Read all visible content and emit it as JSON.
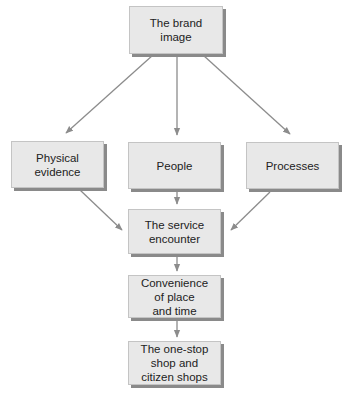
{
  "diagram": {
    "nodes": [
      {
        "id": "brand-image",
        "label": "The brand\nimage"
      },
      {
        "id": "physical-evidence",
        "label": "Physical\nevidence"
      },
      {
        "id": "people",
        "label": "People"
      },
      {
        "id": "processes",
        "label": "Processes"
      },
      {
        "id": "service-encounter",
        "label": "The service\nencounter"
      },
      {
        "id": "convenience",
        "label": "Convenience\nof place\nand time"
      },
      {
        "id": "one-stop-shop",
        "label": "The one-stop\nshop and\ncitizen shops"
      }
    ],
    "edges": [
      {
        "from": "brand-image",
        "to": "physical-evidence"
      },
      {
        "from": "brand-image",
        "to": "people"
      },
      {
        "from": "brand-image",
        "to": "processes"
      },
      {
        "from": "physical-evidence",
        "to": "service-encounter"
      },
      {
        "from": "people",
        "to": "service-encounter"
      },
      {
        "from": "processes",
        "to": "service-encounter"
      },
      {
        "from": "service-encounter",
        "to": "convenience"
      },
      {
        "from": "convenience",
        "to": "one-stop-shop"
      }
    ],
    "colors": {
      "box_fill": "#e8e8e8",
      "box_shadow": "#8a8a8a",
      "arrow": "#8c8c8c",
      "text": "#222222"
    }
  }
}
